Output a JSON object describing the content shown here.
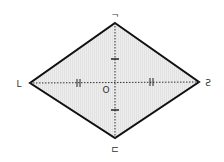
{
  "diagram": {
    "type": "rhombus",
    "vertices": {
      "top": {
        "label": "¬",
        "x": 115,
        "y": 23
      },
      "left": {
        "label": "L",
        "x": 30,
        "y": 83
      },
      "right": {
        "label": "Ƨ",
        "x": 199,
        "y": 82
      },
      "bottom": {
        "label": "⊏",
        "x": 115,
        "y": 138
      }
    },
    "center": {
      "label": "O",
      "x": 115,
      "y": 82
    },
    "diagonals": "dotted",
    "tick_marks": {
      "horizontal": "double",
      "vertical": "single"
    },
    "colors": {
      "edge": "#111111",
      "fill": "#ececec",
      "diagonal": "#333333"
    }
  }
}
